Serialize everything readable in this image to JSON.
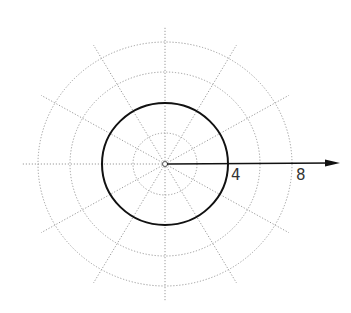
{
  "diagram": {
    "type": "polar-grid",
    "center": {
      "x": 165,
      "y": 164
    },
    "grid_color": "#9a9a9a",
    "curve_color": "#111111",
    "ring_values": [
      2,
      4,
      6,
      8
    ],
    "ring_radius_px_x": [
      32,
      63,
      95,
      127
    ],
    "ring_radius_px_y": [
      31,
      61,
      92,
      122
    ],
    "spoke_angles_deg": [
      0,
      30,
      60,
      90,
      120,
      150,
      180,
      210,
      240,
      270,
      300,
      330
    ],
    "spoke_length_px": 143,
    "highlighted_circle": {
      "r": 4,
      "label": "r = 4"
    },
    "polar_axis": {
      "direction_deg": 0,
      "arrow": true
    },
    "axis_labels": [
      {
        "text": "4",
        "x": 231,
        "y": 168
      },
      {
        "text": "8",
        "x": 296,
        "y": 168
      }
    ]
  }
}
